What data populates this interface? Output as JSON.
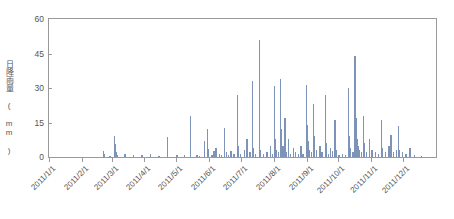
{
  "chart_data": {
    "type": "bar",
    "title": "",
    "subtitle": "",
    "xlabel": "",
    "ylabel": "日降雨量 ( mm )",
    "ylim": [
      0,
      60
    ],
    "yticks": [
      0,
      15,
      30,
      45,
      60
    ],
    "ytick_labels": [
      "0",
      "15",
      "30",
      "45",
      "60"
    ],
    "grid": false,
    "legend": null,
    "x_axis_type": "date",
    "x_range": [
      "2011/1/1",
      "2011/12/31"
    ],
    "xtick_labels": [
      "2011/1/1",
      "2011/2/1",
      "2011/3/1",
      "2011/4/1",
      "2011/5/1",
      "2011/6/1",
      "2011/7/1",
      "2011/8/1",
      "2011/9/1",
      "2011/10/1",
      "2011/11/1",
      "2011/12/1"
    ],
    "xtick_day_of_year": [
      1,
      32,
      60,
      91,
      121,
      152,
      182,
      213,
      244,
      274,
      305,
      335
    ],
    "series_name": "日降雨量",
    "bar_color": "#7e93b8",
    "units": "mm",
    "frame_color": "#9a9a9a",
    "text_color": "#555555",
    "background_color": "#ffffff",
    "points": [
      {
        "day": 52,
        "value": 2.5
      },
      {
        "day": 53,
        "value": 1.5
      },
      {
        "day": 58,
        "value": 0.5
      },
      {
        "day": 62,
        "value": 9.0
      },
      {
        "day": 63,
        "value": 5.5
      },
      {
        "day": 64,
        "value": 2.0
      },
      {
        "day": 65,
        "value": 1.0
      },
      {
        "day": 72,
        "value": 1.5
      },
      {
        "day": 80,
        "value": 1.0
      },
      {
        "day": 88,
        "value": 1.0
      },
      {
        "day": 96,
        "value": 1.5
      },
      {
        "day": 104,
        "value": 0.5
      },
      {
        "day": 112,
        "value": 8.5
      },
      {
        "day": 121,
        "value": 1.0
      },
      {
        "day": 128,
        "value": 1.0
      },
      {
        "day": 134,
        "value": 18.0
      },
      {
        "day": 140,
        "value": 1.0
      },
      {
        "day": 142,
        "value": 0.5
      },
      {
        "day": 147,
        "value": 7.0
      },
      {
        "day": 150,
        "value": 12.0
      },
      {
        "day": 151,
        "value": 3.5
      },
      {
        "day": 154,
        "value": 1.0
      },
      {
        "day": 156,
        "value": 2.5
      },
      {
        "day": 158,
        "value": 4.0
      },
      {
        "day": 161,
        "value": 1.5
      },
      {
        "day": 163,
        "value": 1.0
      },
      {
        "day": 166,
        "value": 12.5
      },
      {
        "day": 168,
        "value": 2.0
      },
      {
        "day": 170,
        "value": 1.0
      },
      {
        "day": 172,
        "value": 2.5
      },
      {
        "day": 175,
        "value": 1.5
      },
      {
        "day": 178,
        "value": 27.0
      },
      {
        "day": 179,
        "value": 5.0
      },
      {
        "day": 181,
        "value": 1.5
      },
      {
        "day": 185,
        "value": 3.0
      },
      {
        "day": 187,
        "value": 8.0
      },
      {
        "day": 190,
        "value": 2.0
      },
      {
        "day": 192,
        "value": 33.0
      },
      {
        "day": 193,
        "value": 4.0
      },
      {
        "day": 195,
        "value": 1.5
      },
      {
        "day": 199,
        "value": 51.0
      },
      {
        "day": 200,
        "value": 3.0
      },
      {
        "day": 203,
        "value": 1.5
      },
      {
        "day": 206,
        "value": 2.0
      },
      {
        "day": 209,
        "value": 5.0
      },
      {
        "day": 211,
        "value": 1.5
      },
      {
        "day": 213,
        "value": 31.0
      },
      {
        "day": 214,
        "value": 8.0
      },
      {
        "day": 215,
        "value": 3.0
      },
      {
        "day": 217,
        "value": 2.0
      },
      {
        "day": 219,
        "value": 34.0
      },
      {
        "day": 220,
        "value": 12.0
      },
      {
        "day": 221,
        "value": 5.0
      },
      {
        "day": 223,
        "value": 17.0
      },
      {
        "day": 224,
        "value": 2.0
      },
      {
        "day": 226,
        "value": 8.0
      },
      {
        "day": 228,
        "value": 1.5
      },
      {
        "day": 231,
        "value": 4.0
      },
      {
        "day": 233,
        "value": 2.0
      },
      {
        "day": 236,
        "value": 1.5
      },
      {
        "day": 238,
        "value": 5.0
      },
      {
        "day": 240,
        "value": 1.5
      },
      {
        "day": 243,
        "value": 31.5
      },
      {
        "day": 244,
        "value": 14.0
      },
      {
        "day": 245,
        "value": 7.0
      },
      {
        "day": 246,
        "value": 3.0
      },
      {
        "day": 248,
        "value": 2.0
      },
      {
        "day": 250,
        "value": 23.0
      },
      {
        "day": 251,
        "value": 9.0
      },
      {
        "day": 253,
        "value": 3.0
      },
      {
        "day": 256,
        "value": 5.0
      },
      {
        "day": 258,
        "value": 2.0
      },
      {
        "day": 261,
        "value": 27.0
      },
      {
        "day": 262,
        "value": 6.0
      },
      {
        "day": 264,
        "value": 1.5
      },
      {
        "day": 266,
        "value": 4.0
      },
      {
        "day": 268,
        "value": 2.5
      },
      {
        "day": 270,
        "value": 16.0
      },
      {
        "day": 271,
        "value": 3.0
      },
      {
        "day": 274,
        "value": 1.0
      },
      {
        "day": 277,
        "value": 1.5
      },
      {
        "day": 280,
        "value": 1.0
      },
      {
        "day": 283,
        "value": 30.0
      },
      {
        "day": 284,
        "value": 9.0
      },
      {
        "day": 285,
        "value": 4.0
      },
      {
        "day": 287,
        "value": 2.0
      },
      {
        "day": 289,
        "value": 44.0
      },
      {
        "day": 290,
        "value": 17.0
      },
      {
        "day": 291,
        "value": 8.0
      },
      {
        "day": 292,
        "value": 5.0
      },
      {
        "day": 293,
        "value": 3.0
      },
      {
        "day": 295,
        "value": 2.0
      },
      {
        "day": 297,
        "value": 18.0
      },
      {
        "day": 298,
        "value": 6.0
      },
      {
        "day": 300,
        "value": 2.0
      },
      {
        "day": 303,
        "value": 8.0
      },
      {
        "day": 305,
        "value": 3.0
      },
      {
        "day": 308,
        "value": 2.0
      },
      {
        "day": 311,
        "value": 1.5
      },
      {
        "day": 314,
        "value": 16.0
      },
      {
        "day": 315,
        "value": 4.0
      },
      {
        "day": 318,
        "value": 2.0
      },
      {
        "day": 321,
        "value": 5.0
      },
      {
        "day": 323,
        "value": 9.5
      },
      {
        "day": 325,
        "value": 2.0
      },
      {
        "day": 328,
        "value": 3.0
      },
      {
        "day": 330,
        "value": 13.5
      },
      {
        "day": 331,
        "value": 3.0
      },
      {
        "day": 334,
        "value": 2.0
      },
      {
        "day": 337,
        "value": 1.5
      },
      {
        "day": 341,
        "value": 4.0
      },
      {
        "day": 345,
        "value": 1.0
      },
      {
        "day": 352,
        "value": 0.5
      }
    ]
  }
}
